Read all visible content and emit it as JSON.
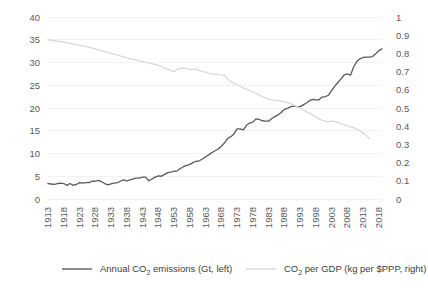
{
  "chart_data": {
    "type": "line",
    "title": "",
    "subtitle": "",
    "xlabel": "",
    "ylabel": "",
    "y2label": "",
    "grid": true,
    "legend_position": "bottom",
    "x_start": 1913,
    "x_end": 2019,
    "x_tick_step": 5,
    "xticks": [
      "1913",
      "1918",
      "1923",
      "1928",
      "1933",
      "1938",
      "1943",
      "1948",
      "1953",
      "1958",
      "1963",
      "1968",
      "1973",
      "1978",
      "1983",
      "1988",
      "1993",
      "1998",
      "2003",
      "2008",
      "2013",
      "2018"
    ],
    "ylim": [
      0,
      40
    ],
    "yticks": [
      "0",
      "5",
      "10",
      "15",
      "20",
      "25",
      "30",
      "35",
      "40"
    ],
    "y2lim": [
      0,
      1
    ],
    "y2ticks": [
      "0",
      "0.1",
      "0.2",
      "0.3",
      "0.4",
      "0.5",
      "0.6",
      "0.7",
      "0.8",
      "0.9",
      "1"
    ],
    "colors": {
      "emissions": "#595959",
      "intensity": "#d9d9d9",
      "grid": "#f2f2f2",
      "text": "#5a5a5a"
    },
    "series": [
      {
        "name": "Annual CO2 emissions (Gt, left)",
        "legend_prefix": "Annual CO",
        "legend_sub": "2",
        "legend_suffix": " emissions (Gt, left)",
        "axis": "left",
        "color": "#595959",
        "x": [
          1913,
          1914,
          1915,
          1916,
          1917,
          1918,
          1919,
          1920,
          1921,
          1922,
          1923,
          1924,
          1925,
          1926,
          1927,
          1928,
          1929,
          1930,
          1931,
          1932,
          1933,
          1934,
          1935,
          1936,
          1937,
          1938,
          1939,
          1940,
          1941,
          1942,
          1943,
          1944,
          1945,
          1946,
          1947,
          1948,
          1949,
          1950,
          1951,
          1952,
          1953,
          1954,
          1955,
          1956,
          1957,
          1958,
          1959,
          1960,
          1961,
          1962,
          1963,
          1964,
          1965,
          1966,
          1967,
          1968,
          1969,
          1970,
          1971,
          1972,
          1973,
          1974,
          1975,
          1976,
          1977,
          1978,
          1979,
          1980,
          1981,
          1982,
          1983,
          1984,
          1985,
          1986,
          1987,
          1988,
          1989,
          1990,
          1991,
          1992,
          1993,
          1994,
          1995,
          1996,
          1997,
          1998,
          1999,
          2000,
          2001,
          2002,
          2003,
          2004,
          2005,
          2006,
          2007,
          2008,
          2009,
          2010,
          2011,
          2012,
          2013,
          2014,
          2015,
          2016,
          2017,
          2018,
          2019
        ],
        "values": [
          3.4,
          3.3,
          3.2,
          3.4,
          3.5,
          3.4,
          3.0,
          3.4,
          3.0,
          3.2,
          3.6,
          3.5,
          3.6,
          3.6,
          3.9,
          3.9,
          4.1,
          3.8,
          3.4,
          3.1,
          3.3,
          3.5,
          3.6,
          3.9,
          4.2,
          4.0,
          4.2,
          4.4,
          4.6,
          4.6,
          4.8,
          4.8,
          4.0,
          4.4,
          4.8,
          5.1,
          5.0,
          5.4,
          5.8,
          5.9,
          6.1,
          6.2,
          6.7,
          7.1,
          7.4,
          7.6,
          8.0,
          8.3,
          8.4,
          8.8,
          9.3,
          9.7,
          10.2,
          10.6,
          11.0,
          11.6,
          12.3,
          13.3,
          13.7,
          14.3,
          15.4,
          15.4,
          15.2,
          16.2,
          16.7,
          16.9,
          17.6,
          17.5,
          17.2,
          17.1,
          17.1,
          17.7,
          18.1,
          18.5,
          19.0,
          19.7,
          19.9,
          20.3,
          20.4,
          20.3,
          20.3,
          20.7,
          21.1,
          21.6,
          21.9,
          21.8,
          21.8,
          22.4,
          22.5,
          22.8,
          23.8,
          24.8,
          25.6,
          26.4,
          27.3,
          27.5,
          27.2,
          29.0,
          30.2,
          30.8,
          31.1,
          31.2,
          31.2,
          31.3,
          31.9,
          32.6,
          33.0
        ],
        "style": "solid",
        "width": 1.3
      },
      {
        "name": "CO2 per GDP (kg per $PPP, right)",
        "legend_prefix": "CO",
        "legend_sub": "2",
        "legend_suffix": " per GDP (kg per $PPP, right)",
        "axis": "right",
        "color": "#d9d9d9",
        "x": [
          1913,
          1918,
          1923,
          1928,
          1933,
          1938,
          1943,
          1948,
          1950,
          1951,
          1952,
          1953,
          1954,
          1955,
          1956,
          1957,
          1958,
          1959,
          1960,
          1961,
          1962,
          1963,
          1964,
          1965,
          1966,
          1967,
          1968,
          1969,
          1970,
          1971,
          1972,
          1973,
          1974,
          1975,
          1976,
          1977,
          1978,
          1979,
          1980,
          1981,
          1982,
          1983,
          1984,
          1985,
          1986,
          1987,
          1988,
          1989,
          1990,
          1991,
          1992,
          1993,
          1994,
          1995,
          1996,
          1997,
          1998,
          1999,
          2000,
          2001,
          2002,
          2003,
          2004,
          2005,
          2006,
          2007,
          2008,
          2009,
          2010,
          2011,
          2012,
          2013,
          2014,
          2015
        ],
        "values": [
          0.875,
          0.862,
          0.845,
          0.825,
          0.8,
          0.775,
          0.755,
          0.735,
          0.72,
          0.712,
          0.705,
          0.7,
          0.712,
          0.718,
          0.72,
          0.718,
          0.71,
          0.712,
          0.713,
          0.705,
          0.7,
          0.698,
          0.69,
          0.686,
          0.684,
          0.686,
          0.682,
          0.68,
          0.66,
          0.645,
          0.635,
          0.63,
          0.62,
          0.61,
          0.604,
          0.596,
          0.588,
          0.582,
          0.572,
          0.562,
          0.556,
          0.548,
          0.545,
          0.543,
          0.54,
          0.538,
          0.534,
          0.53,
          0.524,
          0.516,
          0.508,
          0.5,
          0.49,
          0.48,
          0.472,
          0.462,
          0.45,
          0.44,
          0.432,
          0.428,
          0.424,
          0.428,
          0.426,
          0.42,
          0.414,
          0.408,
          0.4,
          0.396,
          0.392,
          0.384,
          0.374,
          0.362,
          0.35,
          0.332
        ],
        "style": "solid",
        "width": 1.3
      }
    ]
  },
  "legend": {
    "items": [
      {
        "prefix": "Annual CO",
        "sub": "2",
        "suffix": " emissions (Gt, left)",
        "color": "#595959"
      },
      {
        "prefix": "CO",
        "sub": "2",
        "suffix": " per GDP (kg per $PPP, right)",
        "color": "#d9d9d9"
      }
    ]
  }
}
